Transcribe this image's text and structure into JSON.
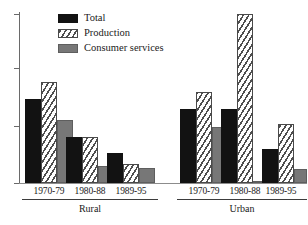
{
  "chart_data": {
    "type": "bar",
    "title": "",
    "subtitle": "",
    "xlabel": "",
    "ylabel": "",
    "grid": false,
    "legend_position": "top-left",
    "axis": {
      "y_tick_labels": [
        "",
        "",
        "",
        ""
      ],
      "y_tick_values": [
        100,
        68,
        34,
        0
      ],
      "ylim": [
        0,
        100
      ],
      "y_axis_visible": true,
      "x_axis_visible": true
    },
    "groups": [
      {
        "name": "Rural",
        "categories": [
          "1970-79",
          "1980-88",
          "1989-95"
        ]
      },
      {
        "name": "Urban",
        "categories": [
          "1970-79",
          "1980-88",
          "1989-95"
        ]
      }
    ],
    "categories": [
      "Rural 1970-79",
      "Rural 1980-88",
      "Rural 1989-95",
      "Urban 1970-79",
      "Urban 1980-88",
      "Urban 1989-95"
    ],
    "series": [
      {
        "name": "Total",
        "color": "#121212",
        "pattern": "solid-black",
        "values": [
          50,
          27,
          18,
          44,
          44,
          20
        ]
      },
      {
        "name": "Production",
        "color": "#ffffff",
        "pattern": "diagonal-hatch",
        "values": [
          60,
          27,
          11,
          54,
          100,
          35
        ]
      },
      {
        "name": "Consumer services",
        "color": "#777777",
        "pattern": "solid-gray",
        "values": [
          37,
          10,
          9,
          33,
          1,
          8
        ]
      }
    ]
  },
  "legend": {
    "items": [
      {
        "label": "Total",
        "swatch": "total-swatch"
      },
      {
        "label": "Production",
        "swatch": "production-swatch"
      },
      {
        "label": "Consumer services",
        "swatch": "consumer-services-swatch"
      }
    ]
  },
  "axis_labels": {
    "rural": {
      "group": "Rural",
      "categories": [
        "1970-79",
        "1980-88",
        "1989-95"
      ]
    },
    "urban": {
      "group": "Urban",
      "categories": [
        "1970-79",
        "1980-88",
        "1989-95"
      ]
    }
  },
  "colors": {
    "total": "#121212",
    "production": "#ffffff",
    "consumer": "#777777",
    "axis": "#6a6a6a",
    "background": "#ffffff"
  }
}
